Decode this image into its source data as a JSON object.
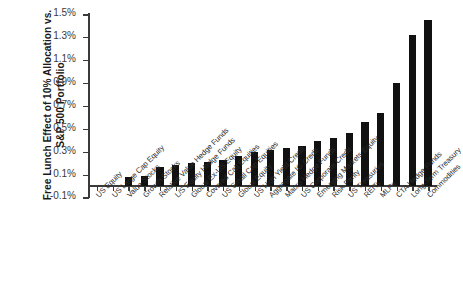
{
  "chart_data": {
    "type": "bar",
    "title": "",
    "subtitle": "",
    "xlabel": "",
    "ylabel": "Free Lunch Effect of 10% Allocation vs. S&P 500 Portfolio",
    "ylabel_lines": [
      "Free Lunch Effect of 10% Allocation vs.",
      "S&P 500 Portfolio"
    ],
    "ylim": [
      -0.1,
      1.5
    ],
    "ytick_labels": [
      "-0.1%",
      "0.1%",
      "0.3%",
      "0.5%",
      "0.7%",
      "0.9%",
      "1.1%",
      "1.3%",
      "1.5%"
    ],
    "ytick_values": [
      -0.1,
      0.1,
      0.3,
      0.5,
      0.7,
      0.9,
      1.1,
      1.3,
      1.5
    ],
    "grid": false,
    "legend": "none",
    "bar_color": "#111111",
    "axis_color": "#3a3a3a",
    "categories": [
      "US Equity",
      "US Large Cap Equity",
      "Value Stocks",
      "Growth Stocks",
      "Relative Value Hedge Funds",
      "L/S Equity Hedge Funds",
      "Global Ex-US Equity",
      "Covered Call Equities",
      "US Small Cap Equities",
      "Global Equity",
      "US High Yield Credit",
      "Aggregate IG Credit",
      "Macro Hedge Funds",
      "US Corporate Credit",
      "Emerging Markets Equity",
      "Risk Parity",
      "US Treasuries",
      "REITs",
      "MLPs",
      "CTA Hedge Funds",
      "Long-Term Treasury",
      "Commodities"
    ],
    "values": [
      0.0,
      0.0,
      0.08,
      0.09,
      0.17,
      0.18,
      0.2,
      0.21,
      0.23,
      0.26,
      0.3,
      0.31,
      0.33,
      0.35,
      0.39,
      0.42,
      0.46,
      0.56,
      0.64,
      0.9,
      1.32,
      1.45
    ]
  }
}
